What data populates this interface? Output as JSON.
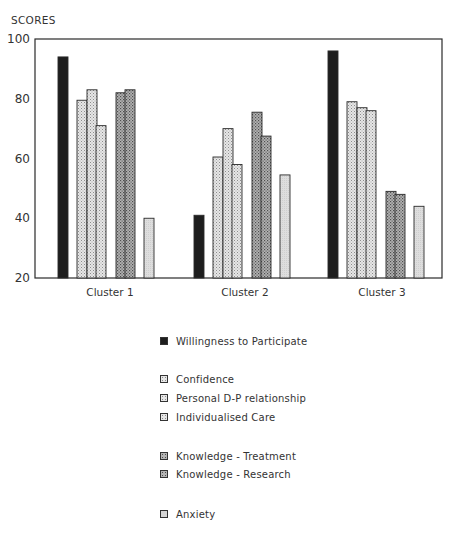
{
  "chart_data": {
    "type": "bar",
    "title": "",
    "ylabel": "SCORES",
    "xlabel": "",
    "ylim": [
      20,
      100
    ],
    "yticks": [
      20,
      40,
      60,
      80,
      100
    ],
    "grid": false,
    "legend_position": "below",
    "categories": [
      "Cluster 1",
      "Cluster 2",
      "Cluster 3"
    ],
    "series": [
      {
        "name": "Willingness to Participate",
        "group": 1,
        "color": "#1e1e1e",
        "pattern": "solid",
        "values": [
          94,
          41,
          96
        ]
      },
      {
        "name": "Confidence",
        "group": 2,
        "color": "#d4d4d4",
        "pattern": "light-stipple",
        "values": [
          79.5,
          60.5,
          79
        ]
      },
      {
        "name": "Personal D-P relationship",
        "group": 2,
        "color": "#d4d4d4",
        "pattern": "light-stipple",
        "values": [
          83,
          70,
          77
        ]
      },
      {
        "name": "Individualised Care",
        "group": 2,
        "color": "#d4d4d4",
        "pattern": "light-stipple",
        "values": [
          71,
          58,
          76
        ]
      },
      {
        "name": "Knowledge - Treatment",
        "group": 3,
        "color": "#9a9a9a",
        "pattern": "dark-stipple",
        "values": [
          82,
          75.5,
          49
        ]
      },
      {
        "name": "Knowledge - Research",
        "group": 3,
        "color": "#9a9a9a",
        "pattern": "dark-stipple",
        "values": [
          83,
          67.5,
          48
        ]
      },
      {
        "name": "Anxiety",
        "group": 4,
        "color": "#dcdcdc",
        "pattern": "light-flat",
        "values": [
          40,
          54.5,
          44
        ]
      }
    ]
  },
  "legend": {
    "items": [
      {
        "label": "Willingness to Participate",
        "pattern": "solid"
      },
      {
        "label": "Confidence",
        "pattern": "light-stipple"
      },
      {
        "label": "Personal D-P relationship",
        "pattern": "light-stipple"
      },
      {
        "label": "Individualised Care",
        "pattern": "light-stipple"
      },
      {
        "label": "Knowledge - Treatment",
        "pattern": "dark-stipple"
      },
      {
        "label": "Knowledge - Research",
        "pattern": "dark-stipple"
      },
      {
        "label": "Anxiety",
        "pattern": "light-flat"
      }
    ]
  }
}
